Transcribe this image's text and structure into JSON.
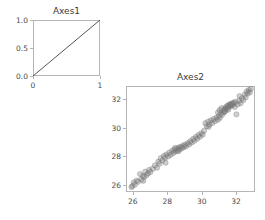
{
  "figure": {
    "width": 265,
    "height": 220,
    "background": "#ffffff",
    "tick_color": "#b5b5b5",
    "text_color": "#3a3a3a"
  },
  "chart_data": [
    {
      "type": "line",
      "name": "axes1",
      "title": "Axes1",
      "xlabel": "",
      "ylabel": "",
      "xlim": [
        0,
        1
      ],
      "ylim": [
        0,
        1
      ],
      "xticks": [
        0,
        1
      ],
      "xticklabels": [
        "0",
        "1"
      ],
      "yticks": [
        0.0,
        0.5,
        1.0
      ],
      "yticklabels": [
        "0.0",
        "0.5",
        "1.0"
      ],
      "grid": false,
      "legend": null,
      "series": [
        {
          "name": "identity",
          "color": "#555555",
          "x": [
            0,
            1
          ],
          "y": [
            0,
            1
          ]
        }
      ]
    },
    {
      "type": "scatter",
      "name": "axes2",
      "title": "Axes2",
      "xlabel": "",
      "ylabel": "",
      "xlim": [
        25.6,
        33.1
      ],
      "ylim": [
        25.5,
        32.9
      ],
      "xticks": [
        26,
        28,
        30,
        32
      ],
      "xticklabels": [
        "26",
        "28",
        "30",
        "32"
      ],
      "yticks": [
        26,
        28,
        30,
        32
      ],
      "yticklabels": [
        "26",
        "28",
        "30",
        "32"
      ],
      "grid": false,
      "legend": null,
      "marker": {
        "shape": "circle",
        "size": 4.2,
        "facecolor": "#808080",
        "edgecolor": "#707070",
        "alpha": 0.38
      },
      "points": [
        [
          25.92,
          25.85
        ],
        [
          25.98,
          25.92
        ],
        [
          26.05,
          26.18
        ],
        [
          26.12,
          26.02
        ],
        [
          26.22,
          26.3
        ],
        [
          26.3,
          26.22
        ],
        [
          26.42,
          26.75
        ],
        [
          26.5,
          26.38
        ],
        [
          26.58,
          26.62
        ],
        [
          26.66,
          26.55
        ],
        [
          26.72,
          26.92
        ],
        [
          26.8,
          26.68
        ],
        [
          26.88,
          26.8
        ],
        [
          26.95,
          27.05
        ],
        [
          27.02,
          26.9
        ],
        [
          27.15,
          27.12
        ],
        [
          27.28,
          27.35
        ],
        [
          27.4,
          27.2
        ],
        [
          27.48,
          27.62
        ],
        [
          27.55,
          27.48
        ],
        [
          27.62,
          27.86
        ],
        [
          27.72,
          27.7
        ],
        [
          27.8,
          28.02
        ],
        [
          27.88,
          27.9
        ],
        [
          27.95,
          28.12
        ],
        [
          28.05,
          27.98
        ],
        [
          28.12,
          28.25
        ],
        [
          28.2,
          28.1
        ],
        [
          28.28,
          28.38
        ],
        [
          28.35,
          28.22
        ],
        [
          28.42,
          28.45
        ],
        [
          28.48,
          28.32
        ],
        [
          28.55,
          28.52
        ],
        [
          28.6,
          28.4
        ],
        [
          28.66,
          28.6
        ],
        [
          28.72,
          28.48
        ],
        [
          28.78,
          28.66
        ],
        [
          28.84,
          28.55
        ],
        [
          28.9,
          28.72
        ],
        [
          28.96,
          28.62
        ],
        [
          29.02,
          28.8
        ],
        [
          29.1,
          28.7
        ],
        [
          29.18,
          28.92
        ],
        [
          29.26,
          28.82
        ],
        [
          29.34,
          29.05
        ],
        [
          29.42,
          28.95
        ],
        [
          29.5,
          29.2
        ],
        [
          29.58,
          29.08
        ],
        [
          29.66,
          29.35
        ],
        [
          29.74,
          29.22
        ],
        [
          29.82,
          29.48
        ],
        [
          29.9,
          29.36
        ],
        [
          29.98,
          29.6
        ],
        [
          30.06,
          29.5
        ],
        [
          30.14,
          29.78
        ],
        [
          30.22,
          30.3
        ],
        [
          30.3,
          30.1
        ],
        [
          30.38,
          30.42
        ],
        [
          30.46,
          30.2
        ],
        [
          30.54,
          30.5
        ],
        [
          30.62,
          30.32
        ],
        [
          30.7,
          30.6
        ],
        [
          30.78,
          30.45
        ],
        [
          30.86,
          30.7
        ],
        [
          30.94,
          30.55
        ],
        [
          31.0,
          30.82
        ],
        [
          31.06,
          30.68
        ],
        [
          31.12,
          31.0
        ],
        [
          31.18,
          30.88
        ],
        [
          31.24,
          31.18
        ],
        [
          31.28,
          31.05
        ],
        [
          31.32,
          31.3
        ],
        [
          31.36,
          31.15
        ],
        [
          31.4,
          31.42
        ],
        [
          31.44,
          31.28
        ],
        [
          31.48,
          31.5
        ],
        [
          31.52,
          31.38
        ],
        [
          31.56,
          31.58
        ],
        [
          31.6,
          31.46
        ],
        [
          31.64,
          31.62
        ],
        [
          31.68,
          31.52
        ],
        [
          31.72,
          31.66
        ],
        [
          31.76,
          31.55
        ],
        [
          31.8,
          31.7
        ],
        [
          31.84,
          31.6
        ],
        [
          31.88,
          31.74
        ],
        [
          31.92,
          31.44
        ],
        [
          31.96,
          31.8
        ],
        [
          32.02,
          30.92
        ],
        [
          32.1,
          31.62
        ],
        [
          32.18,
          31.88
        ],
        [
          32.26,
          31.7
        ],
        [
          32.34,
          32.05
        ],
        [
          32.42,
          31.92
        ],
        [
          32.5,
          32.3
        ],
        [
          32.56,
          32.12
        ],
        [
          32.62,
          32.52
        ],
        [
          32.68,
          32.38
        ],
        [
          32.74,
          32.62
        ],
        [
          32.8,
          32.46
        ],
        [
          32.86,
          32.7
        ],
        [
          30.95,
          31.05
        ],
        [
          31.15,
          31.35
        ],
        [
          31.35,
          31.12
        ],
        [
          31.55,
          31.25
        ],
        [
          31.05,
          31.22
        ],
        [
          28.65,
          28.35
        ],
        [
          28.45,
          28.58
        ],
        [
          26.6,
          26.28
        ],
        [
          27.9,
          27.55
        ],
        [
          30.4,
          30.05
        ],
        [
          32.2,
          32.2
        ]
      ]
    }
  ]
}
